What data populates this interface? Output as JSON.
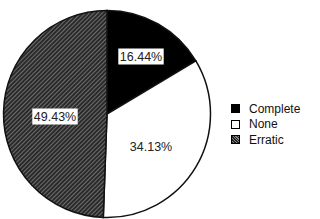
{
  "chart_data": {
    "type": "pie",
    "title": "",
    "categories": [
      "Complete",
      "None",
      "Erratic"
    ],
    "values": [
      16.44,
      34.13,
      49.43
    ],
    "labels": [
      "16.44%",
      "34.13%",
      "49.43%"
    ],
    "colors": {
      "Complete": "#000000",
      "None": "#ffffff",
      "Erratic": "hatched"
    },
    "start_angle": "top, clockwise",
    "legend_position": "right"
  },
  "legend": {
    "items": [
      {
        "label": "Complete"
      },
      {
        "label": "None"
      },
      {
        "label": "Erratic"
      }
    ]
  }
}
